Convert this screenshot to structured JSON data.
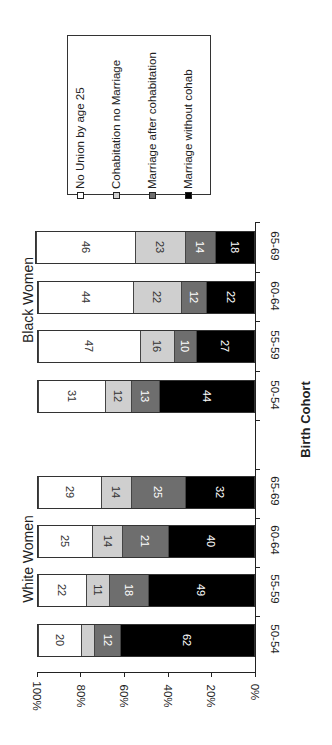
{
  "chart_data": {
    "type": "bar",
    "orientation": "stacked-100-percent, image rotated 90 degrees",
    "title": "",
    "xlabel": "Birth Cohort",
    "ylabel": "",
    "ylim": [
      0,
      100
    ],
    "y_ticks": [
      "0%",
      "20%",
      "40%",
      "60%",
      "80%",
      "100%"
    ],
    "groups": [
      "White Women",
      "Black Women"
    ],
    "categories": [
      "50-54",
      "55-59",
      "60-64",
      "65-69"
    ],
    "legend": [
      "No Union by age 25",
      "Cohabitation no Marriage",
      "Marriage after cohabitation",
      "Marriage without cohab"
    ],
    "series": [
      {
        "name": "Marriage without cohab",
        "color": "#000000",
        "white": [
          62,
          49,
          40,
          32
        ],
        "black": [
          44,
          27,
          22,
          18
        ]
      },
      {
        "name": "Marriage after cohabitation",
        "color": "#6e6e6e",
        "white": [
          12,
          18,
          21,
          25
        ],
        "black": [
          13,
          10,
          12,
          14
        ]
      },
      {
        "name": "Cohabitation no Marriage",
        "color": "#cfcfcf",
        "white": [
          6,
          11,
          14,
          14
        ],
        "black": [
          12,
          16,
          22,
          23
        ]
      },
      {
        "name": "No Union by age 25",
        "color": "#ffffff",
        "white": [
          20,
          22,
          25,
          29
        ],
        "black": [
          31,
          47,
          44,
          46
        ]
      }
    ],
    "segment_labels": {
      "white": [
        [
          "62",
          "12",
          "",
          "20"
        ],
        [
          "49",
          "18",
          "11",
          "22"
        ],
        [
          "40",
          "21",
          "14",
          "25"
        ],
        [
          "32",
          "25",
          "14",
          "29"
        ]
      ],
      "black": [
        [
          "44",
          "13",
          "12",
          "31"
        ],
        [
          "27",
          "10",
          "16",
          "47"
        ],
        [
          "22",
          "12",
          "22",
          "44"
        ],
        [
          "18",
          "14",
          "23",
          "46"
        ]
      ]
    },
    "grid": false,
    "legend_position": "top (rotated)"
  },
  "labels": {
    "group_white": "White Women",
    "group_black": "Black Women",
    "axis_title": "Birth Cohort",
    "legend": {
      "l0": "No Union by age 25",
      "l1": "Cohabitation no Marriage",
      "l2": "Marriage after cohabitation",
      "l3": "Marriage without cohab"
    },
    "ticks": {
      "t0": "0%",
      "t20": "20%",
      "t40": "40%",
      "t60": "60%",
      "t80": "80%",
      "t100": "100%"
    },
    "cats": {
      "b65": "65-69",
      "b60": "60-64",
      "b55": "55-59",
      "b50": "50-54",
      "w65": "65-69",
      "w60": "60-64",
      "w55": "55-59",
      "w50": "50-54"
    }
  }
}
